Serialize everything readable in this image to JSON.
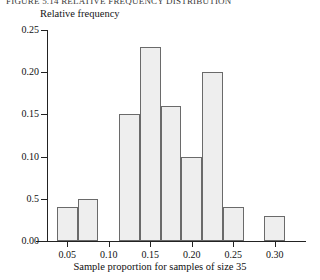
{
  "figure": {
    "clipped_header_text": "FIGURE 5.14 RELATIVE FREQUENCY DISTRIBUTION",
    "background_color": "#ffffff"
  },
  "axes": {
    "y_axis_label": "Relative frequency",
    "x_axis_label": "Sample proportion for samples of size 35",
    "y_tick_labels": [
      "0.25",
      "0.20",
      "0.15",
      "0.10",
      "0.5",
      "0.00"
    ],
    "x_tick_labels": [
      "0.05",
      "0.10",
      "0.15",
      "0.20",
      "0.25",
      "0.30"
    ],
    "axis_color": "#222222"
  },
  "style": {
    "bar_fill": "#eeeeee",
    "bar_stroke": "#6a6a6a"
  },
  "chart_data": {
    "type": "bar",
    "title": "",
    "subtitle": "",
    "xlabel": "Sample proportion for samples of size 35",
    "ylabel": "Relative frequency",
    "xlim": [
      0.0125,
      0.3375
    ],
    "ylim": [
      0.0,
      0.25
    ],
    "grid": false,
    "legend": "none",
    "bin_width": 0.025,
    "y_tick_values": [
      0.0,
      0.05,
      0.1,
      0.15,
      0.2,
      0.25
    ],
    "y_tick_labels_as_printed": [
      "0.00",
      "0.5",
      "0.10",
      "0.15",
      "0.20",
      "0.25"
    ],
    "x_tick_values": [
      0.05,
      0.1,
      0.15,
      0.2,
      0.25,
      0.3
    ],
    "note": "y tick at 0.05 is printed as '0.5' in the source figure",
    "bins": [
      {
        "left": 0.0375,
        "right": 0.0625,
        "value": 0.04
      },
      {
        "left": 0.0625,
        "right": 0.0875,
        "value": 0.05
      },
      {
        "left": 0.0875,
        "right": 0.1125,
        "value": 0.0
      },
      {
        "left": 0.1125,
        "right": 0.1375,
        "value": 0.15
      },
      {
        "left": 0.1375,
        "right": 0.1625,
        "value": 0.23
      },
      {
        "left": 0.1625,
        "right": 0.1875,
        "value": 0.16
      },
      {
        "left": 0.1875,
        "right": 0.2125,
        "value": 0.1
      },
      {
        "left": 0.2125,
        "right": 0.2375,
        "value": 0.2
      },
      {
        "left": 0.2375,
        "right": 0.2625,
        "value": 0.04
      },
      {
        "left": 0.2625,
        "right": 0.2875,
        "value": 0.0
      },
      {
        "left": 0.2875,
        "right": 0.3125,
        "value": 0.03
      }
    ],
    "categories": [
      "0.0375-0.0625",
      "0.0625-0.0875",
      "0.0875-0.1125",
      "0.1125-0.1375",
      "0.1375-0.1625",
      "0.1625-0.1875",
      "0.1875-0.2125",
      "0.2125-0.2375",
      "0.2375-0.2625",
      "0.2625-0.2875",
      "0.2875-0.3125"
    ],
    "values": [
      0.04,
      0.05,
      0.0,
      0.15,
      0.23,
      0.16,
      0.1,
      0.2,
      0.04,
      0.0,
      0.03
    ]
  }
}
